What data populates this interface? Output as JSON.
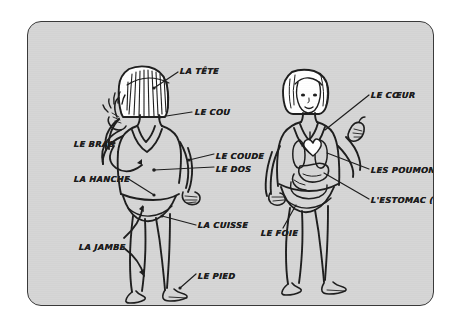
{
  "poster": {
    "title": "Le corps humain — diagramme annoté",
    "background_color": "#d5d5d5",
    "border_color": "#3a3a3a",
    "ink_color": "#1c1c1c",
    "page_background": "#ffffff"
  },
  "figures": [
    {
      "id": "figure-left",
      "name": "Figure de gauche (vue de dos, parties du corps)",
      "view": "back"
    },
    {
      "id": "figure-right",
      "name": "Figure de droite (vue de face, organes internes)",
      "view": "front"
    }
  ],
  "labels_left": [
    {
      "key": "tete",
      "text": "LA TÊTE",
      "x": 152,
      "y": 45
    },
    {
      "key": "cou",
      "text": "LE COU",
      "x": 167,
      "y": 86
    },
    {
      "key": "bras",
      "text": "LE BRAS",
      "x": 46,
      "y": 118
    },
    {
      "key": "coude",
      "text": "LE COUDE",
      "x": 188,
      "y": 130
    },
    {
      "key": "dos",
      "text": "LE DOS",
      "x": 188,
      "y": 143
    },
    {
      "key": "hanche",
      "text": "LA HANCHE",
      "x": 46,
      "y": 153
    },
    {
      "key": "cuisse",
      "text": "LA CUISSE",
      "x": 170,
      "y": 199
    },
    {
      "key": "jambe",
      "text": "LA JAMBE",
      "x": 51,
      "y": 221
    },
    {
      "key": "pied",
      "text": "LE PIED",
      "x": 170,
      "y": 250
    }
  ],
  "labels_right": [
    {
      "key": "coeur",
      "text": "LE CŒUR",
      "x": 343,
      "y": 69
    },
    {
      "key": "poumons",
      "text": "LES POUMONS (M)",
      "x": 343,
      "y": 144
    },
    {
      "key": "estomac",
      "text": "L'ESTOMAC (M)",
      "x": 343,
      "y": 174
    },
    {
      "key": "foie",
      "text": "LE FOIE",
      "x": 233,
      "y": 207
    }
  ]
}
